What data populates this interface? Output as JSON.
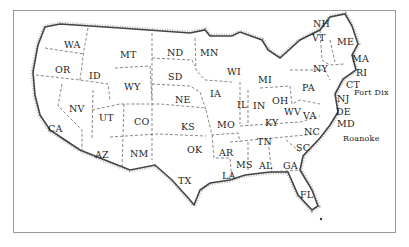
{
  "map": {
    "title": "",
    "states": [
      {
        "abbr": "WA",
        "x": 64,
        "y": 40
      },
      {
        "abbr": "OR",
        "x": 55,
        "y": 65
      },
      {
        "abbr": "ID",
        "x": 89,
        "y": 71
      },
      {
        "abbr": "MT",
        "x": 120,
        "y": 50
      },
      {
        "abbr": "WY",
        "x": 124,
        "y": 82
      },
      {
        "abbr": "ND",
        "x": 167,
        "y": 48
      },
      {
        "abbr": "SD",
        "x": 168,
        "y": 72
      },
      {
        "abbr": "NE",
        "x": 175,
        "y": 95
      },
      {
        "abbr": "MN",
        "x": 200,
        "y": 48
      },
      {
        "abbr": "NV",
        "x": 69,
        "y": 104
      },
      {
        "abbr": "UT",
        "x": 99,
        "y": 113
      },
      {
        "abbr": "CO",
        "x": 134,
        "y": 117
      },
      {
        "abbr": "KS",
        "x": 181,
        "y": 122
      },
      {
        "abbr": "CA",
        "x": 48,
        "y": 124
      },
      {
        "abbr": "AZ",
        "x": 95,
        "y": 150
      },
      {
        "abbr": "NM",
        "x": 130,
        "y": 149
      },
      {
        "abbr": "OK",
        "x": 187,
        "y": 145
      },
      {
        "abbr": "TX",
        "x": 178,
        "y": 176
      },
      {
        "abbr": "IA",
        "x": 210,
        "y": 89
      },
      {
        "abbr": "MO",
        "x": 217,
        "y": 120
      },
      {
        "abbr": "AR",
        "x": 219,
        "y": 148
      },
      {
        "abbr": "LA",
        "x": 222,
        "y": 171
      },
      {
        "abbr": "MS",
        "x": 236,
        "y": 160
      },
      {
        "abbr": "AL",
        "x": 259,
        "y": 161
      },
      {
        "abbr": "GA",
        "x": 283,
        "y": 161
      },
      {
        "abbr": "FL",
        "x": 300,
        "y": 190
      },
      {
        "abbr": "WI",
        "x": 227,
        "y": 67
      },
      {
        "abbr": "IL",
        "x": 237,
        "y": 100
      },
      {
        "abbr": "IN",
        "x": 253,
        "y": 101
      },
      {
        "abbr": "MI",
        "x": 258,
        "y": 75
      },
      {
        "abbr": "OH",
        "x": 272,
        "y": 96
      },
      {
        "abbr": "KY",
        "x": 265,
        "y": 118
      },
      {
        "abbr": "TN",
        "x": 257,
        "y": 137
      },
      {
        "abbr": "WV",
        "x": 284,
        "y": 107
      },
      {
        "abbr": "VA",
        "x": 303,
        "y": 111
      },
      {
        "abbr": "NC",
        "x": 304,
        "y": 127
      },
      {
        "abbr": "SC",
        "x": 296,
        "y": 143
      },
      {
        "abbr": "PA",
        "x": 302,
        "y": 83
      },
      {
        "abbr": "NY",
        "x": 313,
        "y": 64
      },
      {
        "abbr": "NJ",
        "x": 337,
        "y": 94
      },
      {
        "abbr": "DE",
        "x": 336,
        "y": 107
      },
      {
        "abbr": "MD",
        "x": 337,
        "y": 119
      },
      {
        "abbr": "CT",
        "x": 346,
        "y": 80
      },
      {
        "abbr": "RI",
        "x": 356,
        "y": 68
      },
      {
        "abbr": "MA",
        "x": 352,
        "y": 54
      },
      {
        "abbr": "ME",
        "x": 337,
        "y": 37
      },
      {
        "abbr": "VT",
        "x": 312,
        "y": 33
      },
      {
        "abbr": "NH",
        "x": 313,
        "y": 19
      }
    ],
    "places": [
      {
        "name": "Fort Dix",
        "x": 354,
        "y": 89
      },
      {
        "name": "Roanoke",
        "x": 343,
        "y": 135
      }
    ],
    "colors": {
      "background": "#ffffff",
      "border": "#9a9a9a",
      "coast": "#444444",
      "state_lines": "#555555",
      "text": "#222222"
    }
  }
}
